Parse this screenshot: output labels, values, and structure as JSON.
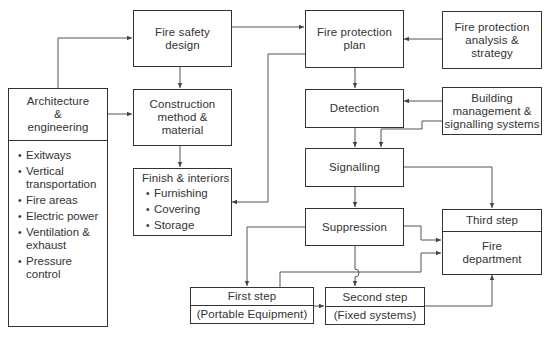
{
  "diagram": {
    "type": "flowchart",
    "nodes": {
      "fire_safety_design": {
        "label": "Fire safety design",
        "lines": [
          "Fire safety",
          "design"
        ]
      },
      "fire_protection_plan": {
        "label": "Fire protection plan",
        "lines": [
          "Fire protection",
          "plan"
        ]
      },
      "fire_protection_analysis": {
        "label": "Fire protection analysis & strategy",
        "lines": [
          "Fire protection",
          "analysis &",
          "strategy"
        ]
      },
      "architecture": {
        "label": "Architecture & engineering",
        "lines": [
          "Architecture",
          "&",
          "engineering"
        ],
        "items": [
          "Exitways",
          "Vertical transportation",
          "Fire areas",
          "Electric power",
          "Ventilation & exhaust",
          "Pressure control"
        ]
      },
      "construction": {
        "label": "Construction method & material",
        "lines": [
          "Construction",
          "method &",
          "material"
        ]
      },
      "detection": {
        "label": "Detection"
      },
      "building_management": {
        "label": "Building management & signalling systems",
        "lines": [
          "Building",
          "management &",
          "signalling systems"
        ]
      },
      "finish": {
        "label": "Finish & interiors",
        "items": [
          "Furnishing",
          "Covering",
          "Storage"
        ]
      },
      "signalling": {
        "label": "Signalling"
      },
      "suppression": {
        "label": "Suppression"
      },
      "third_step": {
        "header": "Third step",
        "lines": [
          "Fire",
          "department"
        ]
      },
      "first_step": {
        "header": "First step",
        "sub": "(Portable Equipment)"
      },
      "second_step": {
        "header": "Second step",
        "sub": "(Fixed systems)"
      }
    },
    "edges": [
      [
        "architecture",
        "fire_safety_design"
      ],
      [
        "architecture",
        "construction"
      ],
      [
        "fire_safety_design",
        "construction"
      ],
      [
        "construction",
        "finish"
      ],
      [
        "fire_safety_design",
        "fire_protection_plan"
      ],
      [
        "fire_protection_plan",
        "finish"
      ],
      [
        "fire_protection_analysis",
        "fire_protection_plan"
      ],
      [
        "fire_protection_plan",
        "detection"
      ],
      [
        "building_management",
        "detection"
      ],
      [
        "building_management",
        "signalling"
      ],
      [
        "detection",
        "signalling"
      ],
      [
        "signalling",
        "suppression"
      ],
      [
        "signalling",
        "third_step"
      ],
      [
        "suppression",
        "third_step"
      ],
      [
        "suppression",
        "first_step"
      ],
      [
        "suppression",
        "second_step"
      ],
      [
        "first_step",
        "second_step"
      ],
      [
        "first_step",
        "third_step"
      ],
      [
        "second_step",
        "third_step"
      ]
    ],
    "colors": {
      "line": "#333333",
      "wire": "#555555",
      "background": "#ffffff"
    }
  }
}
